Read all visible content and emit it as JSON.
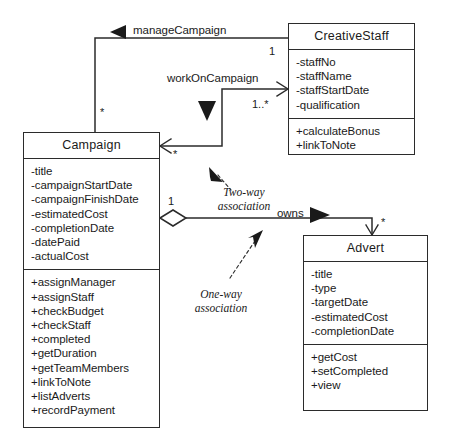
{
  "diagram": {
    "classes": [
      {
        "id": "creativestaff",
        "name": "CreativeStaff",
        "attributes": [
          "-staffNo",
          "-staffName",
          "-staffStartDate",
          "-qualification"
        ],
        "operations": [
          "+calculateBonus",
          "+linkToNote"
        ]
      },
      {
        "id": "campaign",
        "name": "Campaign",
        "attributes": [
          "-title",
          "-campaignStartDate",
          "-campaignFinishDate",
          "-estimatedCost",
          "-completionDate",
          "-datePaid",
          "-actualCost"
        ],
        "operations": [
          "+assignManager",
          "+assignStaff",
          "+checkBudget",
          "+checkStaff",
          "+completed",
          "+getDuration",
          "+getTeamMembers",
          "+linkToNote",
          "+listAdverts",
          "+recordPayment"
        ]
      },
      {
        "id": "advert",
        "name": "Advert",
        "attributes": [
          "-title",
          "-type",
          "-targetDate",
          "-estimatedCost",
          "-completionDate"
        ],
        "operations": [
          "+getCost",
          "+setCompleted",
          "+view"
        ]
      }
    ],
    "associations": [
      {
        "id": "manage-campaign",
        "label": "manageCampaign",
        "from": "CreativeStaff",
        "to": "Campaign",
        "source_multiplicity": "1",
        "target_multiplicity": "*",
        "direction_marker": "solid-left-triangle"
      },
      {
        "id": "work-on-campaign",
        "label": "workOnCampaign",
        "from": "Campaign",
        "to": "CreativeStaff",
        "source_multiplicity": "*",
        "target_multiplicity": "1..*",
        "direction_marker": "solid-down-triangle"
      },
      {
        "id": "owns",
        "label": "owns",
        "from": "Campaign",
        "to": "Advert",
        "source_multiplicity": "1",
        "target_multiplicity": "*",
        "direction_marker": "solid-right-triangle",
        "source_end": "hollow-diamond"
      }
    ],
    "annotations": [
      {
        "id": "two-way",
        "line1": "Two-way",
        "line2": "association"
      },
      {
        "id": "one-way",
        "line1": "One-way",
        "line2": "association"
      }
    ],
    "colors": {
      "line": "#2b2b2b",
      "text": "#1a1a1a",
      "background": "#ffffff"
    }
  }
}
